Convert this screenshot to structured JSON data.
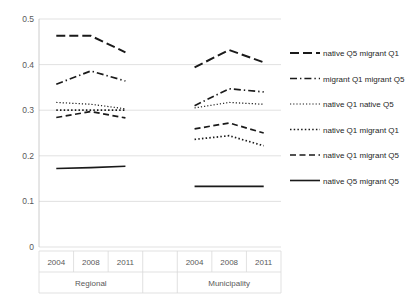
{
  "chart_data": {
    "type": "line",
    "title": "",
    "xlabel": "",
    "ylabel": "",
    "ylim": [
      0,
      0.5
    ],
    "yticks": [
      "0",
      "0.1",
      "0.2",
      "0.3",
      "0.4",
      "0.5"
    ],
    "ytick_values": [
      0,
      0.1,
      0.2,
      0.3,
      0.4,
      0.5
    ],
    "grid": true,
    "legend_position": "right",
    "groups": [
      {
        "name": "Regional",
        "categories": [
          "2004",
          "2008",
          "2011"
        ]
      },
      {
        "name": "",
        "categories": [
          ""
        ]
      },
      {
        "name": "Municipality",
        "categories": [
          "2004",
          "2008",
          "2011"
        ]
      }
    ],
    "x": [
      "2004",
      "2008",
      "2011",
      "",
      "2004",
      "2008",
      "2011"
    ],
    "series": [
      {
        "name": "native Q5 migrant Q1",
        "style": "long-dash",
        "regional": [
          0.463,
          0.463,
          0.427
        ],
        "municipality": [
          0.394,
          0.432,
          0.405
        ]
      },
      {
        "name": "migrant Q1 migrant Q5",
        "style": "dash-dot",
        "regional": [
          0.357,
          0.386,
          0.364
        ],
        "municipality": [
          0.31,
          0.347,
          0.34
        ]
      },
      {
        "name": "native Q1 native Q5",
        "style": "fine-dot",
        "regional": [
          0.317,
          0.313,
          0.303
        ],
        "municipality": [
          0.305,
          0.317,
          0.313
        ]
      },
      {
        "name": "native Q1 migrant Q1",
        "style": "dot",
        "regional": [
          0.3,
          0.3,
          0.3
        ],
        "municipality": [
          0.236,
          0.244,
          0.222
        ]
      },
      {
        "name": "native Q1 migrant Q5",
        "style": "dash",
        "regional": [
          0.284,
          0.297,
          0.283
        ],
        "municipality": [
          0.259,
          0.272,
          0.25
        ]
      },
      {
        "name": "native Q5 migrant Q5",
        "style": "solid",
        "regional": [
          0.172,
          0.174,
          0.177
        ],
        "municipality": [
          0.133,
          0.133,
          0.133
        ]
      }
    ]
  },
  "legend": {
    "items": [
      {
        "label": "native Q5 migrant Q1",
        "style": "long-dash"
      },
      {
        "label": "migrant Q1 migrant Q5",
        "style": "dash-dot"
      },
      {
        "label": "native Q1 native Q5",
        "style": "fine-dot"
      },
      {
        "label": "native Q1 migrant Q1",
        "style": "dot"
      },
      {
        "label": "native Q1 migrant Q5",
        "style": "dash"
      },
      {
        "label": "native Q5 migrant Q5",
        "style": "solid"
      }
    ]
  },
  "colors": {
    "series": "#1a1a1a",
    "grid": "#d9d9d9",
    "text": "#595959",
    "background": "#ffffff"
  }
}
